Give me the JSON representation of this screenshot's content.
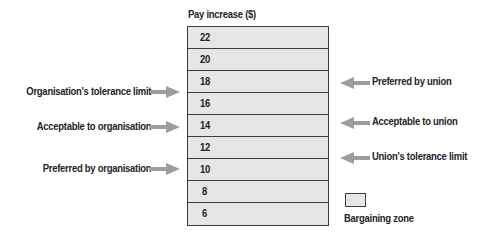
{
  "diagram": {
    "title": "Pay increase ($)",
    "rows": [
      "22",
      "20",
      "18",
      "16",
      "14",
      "12",
      "10",
      "8",
      "6"
    ],
    "left_labels": [
      {
        "text": "Organisation's tolerance limit",
        "points_to": "17"
      },
      {
        "text": "Acceptable to organisation",
        "points_to": "14"
      },
      {
        "text": "Preferred by organisation",
        "points_to": "10"
      }
    ],
    "right_labels": [
      {
        "text": "Preferred by union",
        "points_to": "18"
      },
      {
        "text": "Acceptable to union",
        "points_to": "14"
      },
      {
        "text": "Union's tolerance limit",
        "points_to": "11"
      }
    ],
    "legend": {
      "label": "Bargaining zone"
    },
    "colors": {
      "cell_fill": "#e6e6e6",
      "border": "#3a3d40",
      "arrow": "#9a9ea1",
      "text": "#1f2326"
    }
  }
}
